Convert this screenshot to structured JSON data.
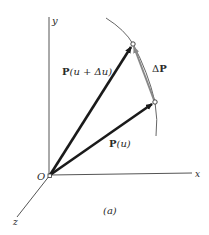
{
  "figure": {
    "caption": "(a)",
    "origin_label": "O",
    "axes": {
      "x_label": "x",
      "y_label": "y",
      "z_label": "z"
    },
    "vectors": [
      {
        "label_bold": "P",
        "label_rest": "(u + Δu)",
        "name": "P(u + Δu)"
      },
      {
        "label_bold": "P",
        "label_rest": "(u)",
        "name": "P(u)"
      }
    ],
    "difference_vector": {
      "label_delta": "Δ",
      "label_bold": "P",
      "name": "ΔP"
    },
    "colors": {
      "axis": "#555555",
      "vector": "#1a1a1a",
      "curve": "#666666",
      "delta_vector": "#888888",
      "background": "#ffffff"
    }
  }
}
